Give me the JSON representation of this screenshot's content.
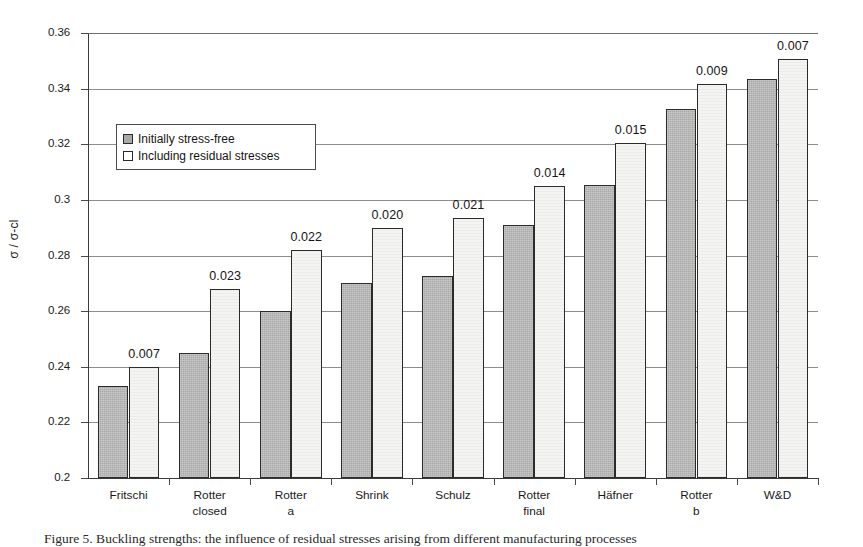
{
  "figure": {
    "caption": "Figure 5. Buckling strengths: the influence of residual stresses arising from different manufacturing processes"
  },
  "legend": {
    "position": "inside-upper-left",
    "entries": [
      {
        "label": "Initially stress-free",
        "swatch": "series-0-swatch"
      },
      {
        "label": "Including residual stresses",
        "swatch": "series-1-swatch"
      }
    ]
  },
  "axes": {
    "y_title": "σ / σ-cl",
    "y_ticks": [
      "0.2",
      "0.22",
      "0.24",
      "0.26",
      "0.28",
      "0.3",
      "0.32",
      "0.34",
      "0.36"
    ],
    "y_min": 0.2,
    "y_max": 0.36,
    "x_title": ""
  },
  "chart_data": {
    "type": "bar",
    "title": "",
    "xlabel": "",
    "ylabel": "σ / σ-cl",
    "ylim": [
      0.2,
      0.36
    ],
    "ytick_step": 0.02,
    "grid": true,
    "legend_position": "inside-upper-left",
    "categories": [
      "Fritschi",
      "Rotter\nclosed",
      "Rotter\na",
      "Shrink",
      "Schulz",
      "Rotter\nfinal",
      "Häfner",
      "Rotter\nb",
      "W&D"
    ],
    "series": [
      {
        "name": "Initially stress-free",
        "values": [
          0.233,
          0.245,
          0.26,
          0.27,
          0.2725,
          0.291,
          0.3055,
          0.3325,
          0.3435
        ]
      },
      {
        "name": "Including residual stresses",
        "values": [
          0.24,
          0.268,
          0.282,
          0.29,
          0.2935,
          0.305,
          0.3205,
          0.3415,
          0.3505
        ]
      }
    ],
    "data_labels": [
      "0.007",
      "0.023",
      "0.022",
      "0.020",
      "0.021",
      "0.014",
      "0.015",
      "0.009",
      "0.007"
    ],
    "data_label_meaning": "difference between series"
  },
  "colors": {
    "series_0_fill": "#a8a8a8",
    "series_1_fill": "#f4f4f2",
    "bar_outline": "#2b2b2b",
    "gridline": "#8d8d8d",
    "axis": "#3a3a3a",
    "text": "#1a1a1a"
  }
}
